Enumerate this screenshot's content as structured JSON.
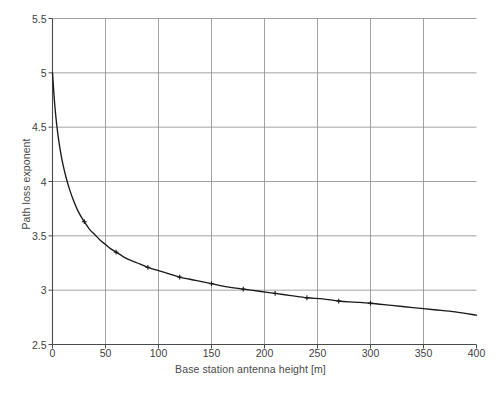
{
  "chart_data": {
    "type": "line",
    "title": "",
    "xlabel": "Base station antenna height [m]",
    "ylabel": "Path loss exponent",
    "xlim": [
      0,
      400
    ],
    "ylim": [
      2.5,
      5.5
    ],
    "xticks": [
      "0",
      "50",
      "100",
      "150",
      "200",
      "250",
      "300",
      "350",
      "400"
    ],
    "yticks": [
      "2.5",
      "3",
      "3.5",
      "4",
      "4.5",
      "5",
      "5.5"
    ],
    "xtick_values": [
      0,
      50,
      100,
      150,
      200,
      250,
      300,
      350,
      400
    ],
    "ytick_values": [
      2.5,
      3,
      3.5,
      4,
      4.5,
      5,
      5.5
    ],
    "grid": true,
    "legend": "none",
    "marker": "plus",
    "line_color": "#1a1a1a",
    "grid_color": "#8c8c8c",
    "axis_color": "#4a4a4a",
    "series": [
      {
        "name": "Path loss exponent",
        "x": [
          0,
          2,
          4,
          6,
          8,
          10,
          13,
          16,
          20,
          24,
          28,
          30,
          35,
          40,
          45,
          50,
          55,
          60,
          70,
          80,
          90,
          100,
          110,
          120,
          135,
          150,
          165,
          180,
          195,
          210,
          225,
          240,
          255,
          270,
          285,
          300,
          320,
          340,
          360,
          380,
          400
        ],
        "y": [
          5.0,
          4.72,
          4.52,
          4.37,
          4.25,
          4.15,
          4.03,
          3.93,
          3.82,
          3.73,
          3.66,
          3.63,
          3.56,
          3.51,
          3.46,
          3.42,
          3.38,
          3.35,
          3.29,
          3.25,
          3.21,
          3.18,
          3.15,
          3.12,
          3.09,
          3.06,
          3.03,
          3.01,
          2.99,
          2.97,
          2.95,
          2.93,
          2.92,
          2.9,
          2.89,
          2.88,
          2.86,
          2.84,
          2.82,
          2.8,
          2.77
        ]
      }
    ],
    "markers": {
      "x": [
        30,
        60,
        90,
        120,
        150,
        180,
        210,
        240,
        270,
        300
      ],
      "y": [
        3.63,
        3.35,
        3.21,
        3.12,
        3.06,
        3.01,
        2.97,
        2.93,
        2.9,
        2.88
      ]
    }
  },
  "caption": {
    "text": ""
  }
}
